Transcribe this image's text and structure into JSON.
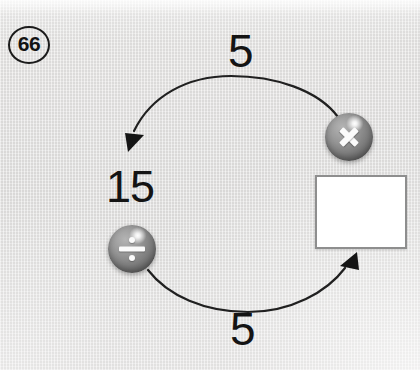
{
  "problem": {
    "number_label": "66",
    "kind": "inverse-operations-loop",
    "background_color": "#e3e3e2",
    "ink_color": "#141414"
  },
  "diagram": {
    "start_value": "15",
    "answer_box": {
      "value": "",
      "placeholder": "",
      "fill_color": "#ffffff",
      "border_color": "#8e8e8e"
    },
    "operators": [
      {
        "id": "multiply",
        "glyph": "X",
        "icon": "multiply-icon",
        "operand": "5",
        "direction": "forward",
        "description": "15 multiplied by 5 gives the boxed value"
      },
      {
        "id": "divide",
        "glyph": "÷",
        "icon": "divide-icon",
        "operand": "5",
        "direction": "reverse",
        "description": "the boxed value divided by 5 gives 15"
      }
    ],
    "arrow_labels": {
      "top": "5",
      "bottom": "5"
    }
  }
}
